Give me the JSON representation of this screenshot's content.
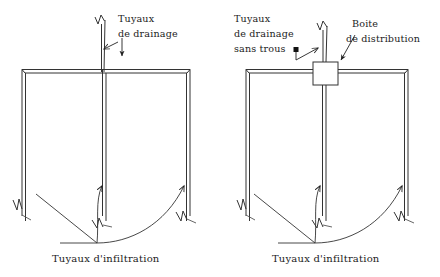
{
  "figure": {
    "background_color": "#ffffff",
    "line_color": "#333333",
    "text_color": "#1c1c1c"
  },
  "left_diagram": {
    "name": "champ d'infiltration avec tuyaux de drainage",
    "labels": {
      "drain_line1": "Tuyaux",
      "drain_line2": "de drainage"
    },
    "caption": "Tuyaux d'infiltration"
  },
  "right_diagram": {
    "name": "champ d'infiltration avec boite de distribution",
    "labels": {
      "drain_line1": "Tuyaux",
      "drain_line2": "de drainage",
      "drain_line3": "sans trous",
      "box_line1": "Boite",
      "box_line2": "de distribution"
    },
    "caption": "Tuyaux d'infiltration"
  }
}
